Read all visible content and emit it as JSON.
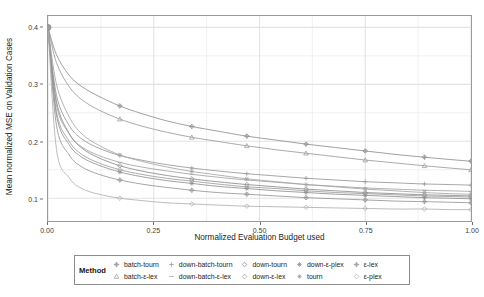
{
  "chart_data": {
    "type": "line",
    "title": "",
    "xlabel": "Normalized Evaluation Budget used",
    "ylabel": "Mean normalized MSE on Validation Cases",
    "xlim": [
      0.0,
      1.0
    ],
    "ylim": [
      0.06,
      0.42
    ],
    "xticks": [
      "0.00",
      "0.25",
      "0.50",
      "0.75",
      "1.00"
    ],
    "xtickvals": [
      0.0,
      0.25,
      0.5,
      0.75,
      1.0
    ],
    "yticks": [
      "0.1",
      "0.2",
      "0.3",
      "0.4"
    ],
    "ytickvals": [
      0.1,
      0.2,
      0.3,
      0.4
    ],
    "grid": true,
    "legend_position": "bottom",
    "legend_title": "Method",
    "x": [
      0.0,
      0.02,
      0.05,
      0.08,
      0.12,
      0.17,
      0.22,
      0.28,
      0.34,
      0.4,
      0.47,
      0.54,
      0.61,
      0.68,
      0.75,
      0.82,
      0.89,
      0.95,
      1.0
    ],
    "series": [
      {
        "name": "batch-tourn",
        "marker": "diamond-plus",
        "color": "#8e8e8e",
        "values": [
          0.4,
          0.352,
          0.316,
          0.296,
          0.279,
          0.262,
          0.249,
          0.236,
          0.226,
          0.218,
          0.209,
          0.202,
          0.195,
          0.189,
          0.183,
          0.177,
          0.172,
          0.168,
          0.165
        ]
      },
      {
        "name": "batch-ε-lex",
        "marker": "triangle",
        "color": "#9a9a9a",
        "values": [
          0.4,
          0.338,
          0.296,
          0.273,
          0.255,
          0.239,
          0.227,
          0.216,
          0.207,
          0.2,
          0.192,
          0.185,
          0.179,
          0.173,
          0.167,
          0.162,
          0.157,
          0.153,
          0.15
        ]
      },
      {
        "name": "down-batch-tourn",
        "marker": "plus",
        "color": "#979797",
        "values": [
          0.4,
          0.281,
          0.228,
          0.204,
          0.188,
          0.175,
          0.167,
          0.159,
          0.153,
          0.148,
          0.143,
          0.139,
          0.135,
          0.132,
          0.129,
          0.127,
          0.125,
          0.124,
          0.123
        ]
      },
      {
        "name": "down-batch-ε-lex",
        "marker": "dash",
        "color": "#a2a2a2",
        "values": [
          0.4,
          0.264,
          0.213,
          0.19,
          0.175,
          0.163,
          0.155,
          0.148,
          0.142,
          0.137,
          0.132,
          0.128,
          0.124,
          0.121,
          0.118,
          0.116,
          0.114,
          0.113,
          0.112
        ]
      },
      {
        "name": "down-tourn",
        "marker": "diamond",
        "color": "#8b8b8b",
        "values": [
          0.4,
          0.27,
          0.214,
          0.188,
          0.171,
          0.157,
          0.148,
          0.14,
          0.134,
          0.129,
          0.124,
          0.12,
          0.116,
          0.113,
          0.11,
          0.108,
          0.106,
          0.105,
          0.104
        ]
      },
      {
        "name": "down-ε-lex",
        "marker": "diamond-open",
        "color": "#9d9d9d",
        "values": [
          0.4,
          0.252,
          0.2,
          0.177,
          0.162,
          0.15,
          0.142,
          0.135,
          0.13,
          0.125,
          0.12,
          0.117,
          0.113,
          0.11,
          0.108,
          0.106,
          0.104,
          0.103,
          0.102
        ]
      },
      {
        "name": "down-ε-plex",
        "marker": "asterisk",
        "color": "#8f8f8f",
        "values": [
          0.4,
          0.246,
          0.194,
          0.172,
          0.158,
          0.146,
          0.138,
          0.131,
          0.126,
          0.121,
          0.117,
          0.113,
          0.11,
          0.107,
          0.105,
          0.103,
          0.101,
          0.1,
          0.099
        ]
      },
      {
        "name": "tourn",
        "marker": "star",
        "color": "#a5a5a5",
        "values": [
          0.4,
          0.3,
          0.243,
          0.213,
          0.193,
          0.176,
          0.165,
          0.155,
          0.147,
          0.141,
          0.134,
          0.129,
          0.124,
          0.12,
          0.116,
          0.113,
          0.11,
          0.108,
          0.107
        ]
      },
      {
        "name": "ε-lex",
        "marker": "diamond-cross",
        "color": "#969696",
        "values": [
          0.4,
          0.228,
          0.176,
          0.155,
          0.142,
          0.132,
          0.125,
          0.119,
          0.114,
          0.11,
          0.107,
          0.104,
          0.101,
          0.099,
          0.097,
          0.095,
          0.094,
          0.093,
          0.092
        ]
      },
      {
        "name": "ε-plex",
        "marker": "diamond-thin",
        "color": "#b0b0b0",
        "values": [
          0.4,
          0.186,
          0.136,
          0.117,
          0.107,
          0.1,
          0.096,
          0.092,
          0.09,
          0.088,
          0.086,
          0.085,
          0.084,
          0.083,
          0.082,
          0.081,
          0.081,
          0.08,
          0.08
        ]
      }
    ],
    "start_point": {
      "x": 0.0,
      "y": 0.4,
      "label": "common-start"
    }
  },
  "legend": {
    "title": "Method",
    "items": [
      {
        "label": "batch-tourn"
      },
      {
        "label": "down-batch-tourn"
      },
      {
        "label": "down-tourn"
      },
      {
        "label": "down-ε-plex"
      },
      {
        "label": "ε-lex"
      },
      {
        "label": "batch-ε-lex"
      },
      {
        "label": "down-batch-ε-lex"
      },
      {
        "label": "down-ε-lex"
      },
      {
        "label": "tourn"
      },
      {
        "label": "ε-plex"
      }
    ]
  },
  "style": {
    "grid_color": "#ebebeb",
    "panel_border": "#9a9a9a",
    "text_color": "#1e1e1e"
  }
}
